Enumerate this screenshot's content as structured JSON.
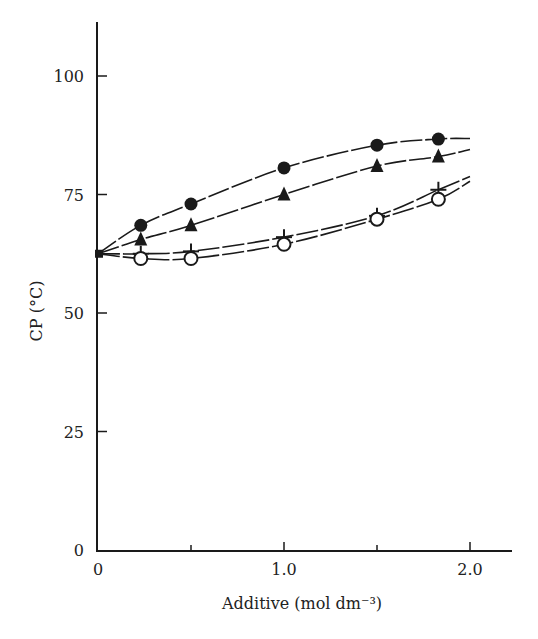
{
  "chart_data": {
    "type": "line",
    "title": "",
    "xlabel": "Additive (mol dm⁻³)",
    "ylabel": "CP (°C)",
    "xlim": [
      0,
      2.2
    ],
    "ylim": [
      0,
      110
    ],
    "x_ticks": [
      0,
      0.5,
      1.0,
      1.5,
      2.0
    ],
    "x_tick_labels": [
      "0",
      "",
      "1.0",
      "",
      "2.0"
    ],
    "y_ticks": [
      0,
      25,
      50,
      75,
      100
    ],
    "y_tick_labels": [
      "0",
      "25",
      "50",
      "75",
      "100"
    ],
    "grid": false,
    "legend": null,
    "series": [
      {
        "name": "filled-circle",
        "marker": "filled-circle",
        "x": [
          0,
          0.23,
          0.5,
          1.0,
          1.5,
          1.83
        ],
        "y": [
          62.5,
          68.5,
          73.0,
          80.6,
          85.4,
          86.7
        ],
        "curve_end": [
          2.0,
          86.8
        ]
      },
      {
        "name": "filled-triangle",
        "marker": "filled-triangle",
        "x": [
          0,
          0.23,
          0.5,
          1.0,
          1.5,
          1.83
        ],
        "y": [
          62.5,
          65.5,
          68.5,
          75.0,
          81.0,
          83.0
        ],
        "curve_end": [
          2.0,
          84.5
        ]
      },
      {
        "name": "plus",
        "marker": "plus",
        "x": [
          0,
          0.23,
          0.5,
          1.0,
          1.5,
          1.83
        ],
        "y": [
          62.5,
          62.5,
          63.0,
          66.0,
          70.5,
          76.0
        ],
        "curve_end": [
          2.0,
          78.8
        ]
      },
      {
        "name": "open-circle",
        "marker": "open-circle",
        "x": [
          0,
          0.23,
          0.5,
          1.0,
          1.5,
          1.83
        ],
        "y": [
          62.5,
          61.5,
          61.5,
          64.5,
          69.8,
          74.0
        ],
        "curve_end": [
          2.0,
          77.8
        ]
      }
    ]
  },
  "colors": {
    "ink": "#1a1a1a",
    "background": "#ffffff"
  }
}
